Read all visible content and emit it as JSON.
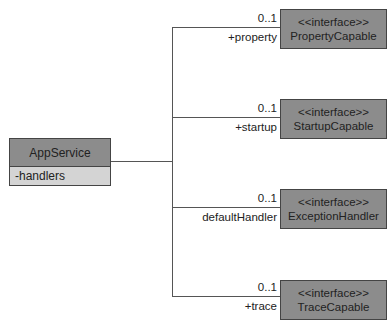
{
  "main_class": {
    "name": "AppService",
    "attributes": [
      "-handlers"
    ]
  },
  "associations": [
    {
      "multiplicity": "0..1",
      "role": "+property",
      "stereotype": "<<interface>>",
      "target": "PropertyCapable"
    },
    {
      "multiplicity": "0..1",
      "role": "+startup",
      "stereotype": "<<interface>>",
      "target": "StartupCapable"
    },
    {
      "multiplicity": "0..1",
      "role": "defaultHandler",
      "stereotype": "<<interface>>",
      "target": "ExceptionHandler"
    },
    {
      "multiplicity": "0..1",
      "role": "+trace",
      "stereotype": "<<interface>>",
      "target": "TraceCapable"
    }
  ],
  "colors": {
    "box_fill": "#8c8c8c",
    "attr_fill": "#d4d4d4",
    "line": "#555555"
  }
}
